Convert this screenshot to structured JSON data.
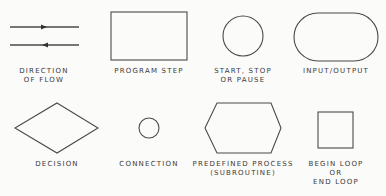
{
  "colors": {
    "stroke": "#4a4a4a",
    "text": "#3a3a3a",
    "background": "#fbfbf9"
  },
  "symbols": [
    {
      "id": "direction-of-flow",
      "shape": "arrows",
      "label_lines": [
        "DIRECTION",
        "OF FLOW"
      ]
    },
    {
      "id": "program-step",
      "shape": "rectangle",
      "label_lines": [
        "PROGRAM STEP"
      ]
    },
    {
      "id": "start-stop-pause",
      "shape": "circle",
      "label_lines": [
        "START, STOP",
        "OR PAUSE"
      ]
    },
    {
      "id": "input-output",
      "shape": "rounded-pill",
      "label_lines": [
        "INPUT/OUTPUT"
      ]
    },
    {
      "id": "decision",
      "shape": "diamond",
      "label_lines": [
        "DECISION"
      ]
    },
    {
      "id": "connection",
      "shape": "small-circle",
      "label_lines": [
        "CONNECTION"
      ]
    },
    {
      "id": "predefined-process",
      "shape": "hexagon",
      "label_lines": [
        "PREDEFINED PROCESS",
        "(SUBROUTINE)"
      ]
    },
    {
      "id": "begin-end-loop",
      "shape": "square",
      "label_lines": [
        "BEGIN LOOP",
        "OR",
        "END LOOP"
      ]
    }
  ]
}
